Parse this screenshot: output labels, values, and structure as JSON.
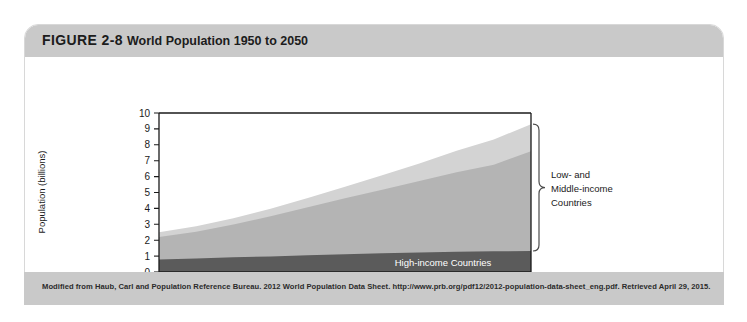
{
  "figure": {
    "number": "FIGURE 2-8",
    "title": "World Population 1950 to 2050",
    "source": "Modified from Haub, Carl and Population Reference Bureau. 2012 World Population Data Sheet. http://www.prb.org/pdf12/2012-population-data-sheet_eng.pdf. Retrieved April 29, 2015."
  },
  "chart_data": {
    "type": "area",
    "title": "World Population 1950 to 2050",
    "xlabel": "",
    "ylabel": "Population (billions)",
    "xlim": [
      1950,
      2050
    ],
    "ylim": [
      0,
      10
    ],
    "xticks": [
      "1950",
      "1970",
      "1990",
      "2010",
      "2030",
      "2050"
    ],
    "yticks": [
      "0",
      "1",
      "2",
      "3",
      "4",
      "5",
      "6",
      "7",
      "8",
      "9",
      "10"
    ],
    "grid": false,
    "legend_position": "in-plot",
    "stacked": true,
    "x": [
      1950,
      1960,
      1970,
      1980,
      1990,
      2000,
      2010,
      2020,
      2030,
      2040,
      2050
    ],
    "series": [
      {
        "name": "High-income Countries",
        "color": "#5b5b5b",
        "values": [
          0.78,
          0.85,
          0.92,
          0.98,
          1.05,
          1.12,
          1.18,
          1.23,
          1.27,
          1.3,
          1.32
        ]
      },
      {
        "name": "Middle-income Countries",
        "color": "#b4b4b4",
        "values": [
          1.42,
          1.68,
          2.06,
          2.52,
          3.02,
          3.52,
          4.0,
          4.5,
          5.0,
          5.45,
          6.28
        ]
      },
      {
        "name": "Low-income Countries",
        "color": "#d3d3d3",
        "values": [
          0.3,
          0.34,
          0.4,
          0.48,
          0.58,
          0.72,
          0.9,
          1.1,
          1.35,
          1.58,
          1.7
        ]
      }
    ],
    "totals": [
      2.5,
      2.87,
      3.38,
      3.98,
      4.65,
      5.36,
      6.08,
      6.83,
      7.62,
      8.33,
      9.3
    ],
    "annotations": [
      {
        "name": "high-income-band-label",
        "text": "High-income Countries",
        "placement": "inside-dark-band"
      },
      {
        "name": "low-middle-income-brace-label",
        "text": "Low- and\nMiddle-income\nCountries",
        "lines": [
          "Low- and",
          "Middle-income",
          "Countries"
        ],
        "placement": "right-brace"
      }
    ]
  }
}
